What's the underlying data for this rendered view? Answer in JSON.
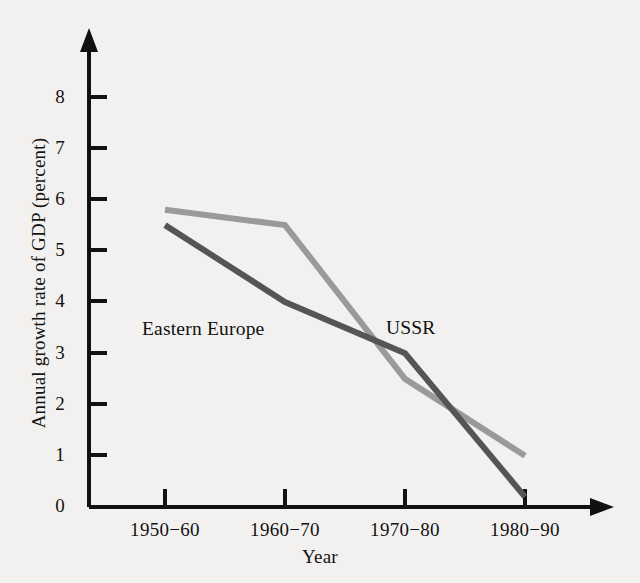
{
  "chart_data": {
    "type": "line",
    "title": "",
    "subtitle": "",
    "xlabel": "Year",
    "ylabel": "Annual growth rate of GDP (percent)",
    "categories": [
      "1950−60",
      "1960−70",
      "1970−80",
      "1980−90"
    ],
    "yticks": [
      "0",
      "1",
      "2",
      "3",
      "4",
      "5",
      "6",
      "7",
      "8"
    ],
    "ylim": [
      0,
      8.8
    ],
    "grid": false,
    "legend_position": "inline-annotations",
    "series": [
      {
        "name": "USSR",
        "color": "#9a9a9a",
        "values": [
          5.8,
          5.5,
          2.5,
          1.0
        ]
      },
      {
        "name": "Eastern Europe",
        "color": "#555555",
        "values": [
          5.5,
          4.0,
          3.0,
          0.2
        ]
      }
    ],
    "annotations": [
      {
        "text": "Eastern Europe",
        "series": "Eastern Europe"
      },
      {
        "text": "USSR",
        "series": "USSR"
      }
    ],
    "axis_color": "#111111",
    "background_color": "#f2f1ef"
  }
}
